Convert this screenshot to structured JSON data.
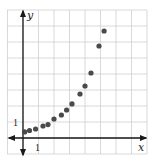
{
  "chart_data": {
    "type": "scatter",
    "title": "",
    "xlabel": "x",
    "ylabel": "y",
    "x_tick_labels": [
      "1"
    ],
    "y_tick_labels": [
      "1"
    ],
    "grid": true,
    "legend": null,
    "xlim": [
      -1,
      8
    ],
    "ylim": [
      -1,
      8
    ],
    "series": [
      {
        "name": "data",
        "color": "#4a4a4a",
        "points": [
          {
            "x": 0.1,
            "y": 0.38
          },
          {
            "x": 0.42,
            "y": 0.47
          },
          {
            "x": 0.81,
            "y": 0.56
          },
          {
            "x": 1.29,
            "y": 0.75
          },
          {
            "x": 1.61,
            "y": 0.84
          },
          {
            "x": 2.0,
            "y": 1.19
          },
          {
            "x": 2.48,
            "y": 1.44
          },
          {
            "x": 2.81,
            "y": 1.75
          },
          {
            "x": 3.16,
            "y": 2.13
          },
          {
            "x": 3.68,
            "y": 2.75
          },
          {
            "x": 4.0,
            "y": 3.25
          },
          {
            "x": 4.39,
            "y": 4.06
          },
          {
            "x": 4.9,
            "y": 5.75
          },
          {
            "x": 5.23,
            "y": 6.69
          }
        ]
      }
    ]
  },
  "layout": {
    "origin_px": [
      23,
      138
    ],
    "unit_px_x": 15.5,
    "unit_px_y": 16,
    "grid_color": "#cfcfcf",
    "axis_color": "#1a1a1a",
    "point_color": "#4a4a4a"
  },
  "labels": {
    "x_axis": "x",
    "y_axis": "y",
    "x_tick_one": "1",
    "y_tick_one": "1"
  }
}
